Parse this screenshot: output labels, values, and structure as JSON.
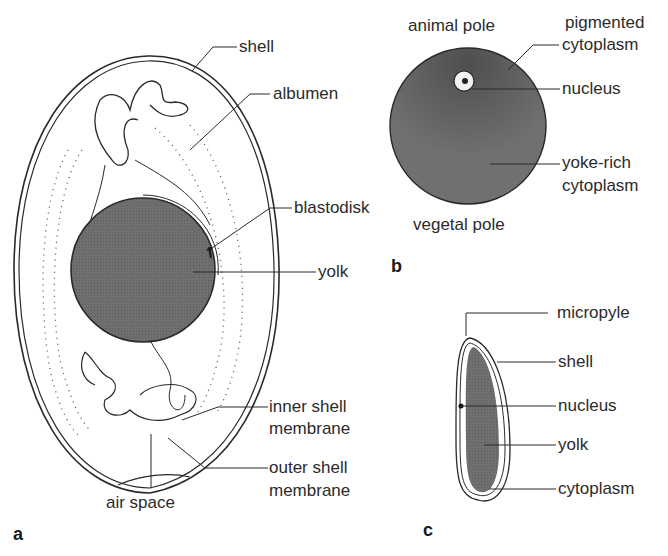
{
  "figure": {
    "panels": [
      {
        "id": "a",
        "letter": "a",
        "subject": "bird egg",
        "labels": {
          "shell": "shell",
          "albumen": "albumen",
          "blastodisk": "blastodisk",
          "yolk": "yolk",
          "inner_shell_membrane_1": "inner shell",
          "inner_shell_membrane_2": "membrane",
          "outer_shell_membrane_1": "outer shell",
          "outer_shell_membrane_2": "membrane",
          "air_space": "air space"
        }
      },
      {
        "id": "b",
        "letter": "b",
        "subject": "amphibian egg",
        "labels": {
          "animal_pole": "animal pole",
          "pigmented_cytoplasm_1": "pigmented",
          "pigmented_cytoplasm_2": "cytoplasm",
          "nucleus": "nucleus",
          "yoke_rich_1": "yoke-rich",
          "yoke_rich_2": "cytoplasm",
          "vegetal_pole": "vegetal pole"
        }
      },
      {
        "id": "c",
        "letter": "c",
        "subject": "insect egg",
        "labels": {
          "micropyle": "micropyle",
          "shell": "shell",
          "nucleus": "nucleus",
          "yolk": "yolk",
          "cytoplasm": "cytoplasm"
        }
      }
    ],
    "colors": {
      "yolk_fill": "#6e6e6e",
      "line": "#2a2a2a",
      "background": "#ffffff"
    }
  }
}
